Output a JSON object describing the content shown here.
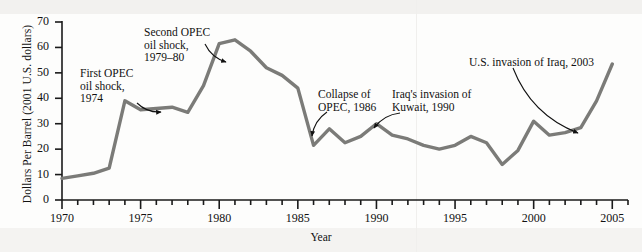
{
  "figure": {
    "background_color": "#fdfdfc",
    "line_color": "#7b7b78",
    "axis_color": "#1a1a1a",
    "text_color": "#111111"
  },
  "chart_data": {
    "type": "line",
    "title": "",
    "xlabel": "Year",
    "ylabel": "Dollars Per Barrel (2001 U.S. dollars)",
    "xlim": [
      1970,
      2006
    ],
    "ylim": [
      0,
      70
    ],
    "ytick_labels": [
      "0",
      "10",
      "20",
      "30",
      "40",
      "50",
      "60",
      "70"
    ],
    "ytick_values": [
      0,
      10,
      20,
      30,
      40,
      50,
      60,
      70
    ],
    "xtick_labels": [
      "1970",
      "1975",
      "1980",
      "1985",
      "1990",
      "1995",
      "2000",
      "2005"
    ],
    "xtick_values": [
      1970,
      1975,
      1980,
      1985,
      1990,
      1995,
      2000,
      2005
    ],
    "minor_xtick_step": 1,
    "grid": false,
    "legend": null,
    "series": [
      {
        "name": "Crude oil price",
        "x": [
          1970,
          1971,
          1972,
          1973,
          1974,
          1975,
          1976,
          1977,
          1978,
          1979,
          1980,
          1981,
          1982,
          1983,
          1984,
          1985,
          1986,
          1987,
          1988,
          1989,
          1990,
          1991,
          1992,
          1993,
          1994,
          1995,
          1996,
          1997,
          1998,
          1999,
          2000,
          2001,
          2002,
          2003,
          2004,
          2005
        ],
        "values": [
          8.5,
          9.5,
          10.5,
          12.5,
          39.0,
          35.5,
          36.0,
          36.5,
          34.5,
          45.0,
          61.5,
          63.0,
          58.5,
          52.0,
          49.0,
          44.0,
          21.5,
          28.0,
          22.5,
          25.0,
          30.0,
          25.5,
          24.0,
          21.5,
          20.0,
          21.5,
          25.0,
          22.5,
          14.0,
          19.5,
          31.0,
          25.5,
          26.5,
          28.5,
          39.0,
          53.5
        ]
      }
    ],
    "annotations": [
      {
        "name": "first-opec-oil-shock",
        "text": "First OPEC\noil shock,\n1974",
        "x_px": 80,
        "y_px": 67,
        "arrow_from": [
          137,
          103
        ],
        "arrow_to": [
          161,
          112
        ]
      },
      {
        "name": "second-opec-oil-shock",
        "text": "Second OPEC\noil shock,\n1979–80",
        "x_px": 144,
        "y_px": 26,
        "arrow_from": [
          205,
          44
        ],
        "arrow_to": [
          226,
          62
        ]
      },
      {
        "name": "collapse-of-opec",
        "text": "Collapse of\nOPEC, 1986",
        "x_px": 318,
        "y_px": 88,
        "arrow_from": [
          327,
          112
        ],
        "arrow_to": [
          312,
          136
        ]
      },
      {
        "name": "iraq-invasion-of-kuwait",
        "text": "Iraq's invasion of\nKuwait, 1990",
        "x_px": 392,
        "y_px": 88,
        "arrow_from": [
          400,
          113
        ],
        "arrow_to": [
          374,
          128
        ]
      },
      {
        "name": "us-invasion-of-iraq",
        "text": "U.S. invasion of Iraq, 2003",
        "x_px": 469,
        "y_px": 56,
        "arrow_from": [
          513,
          68
        ],
        "arrow_to": [
          578,
          133
        ]
      }
    ]
  }
}
